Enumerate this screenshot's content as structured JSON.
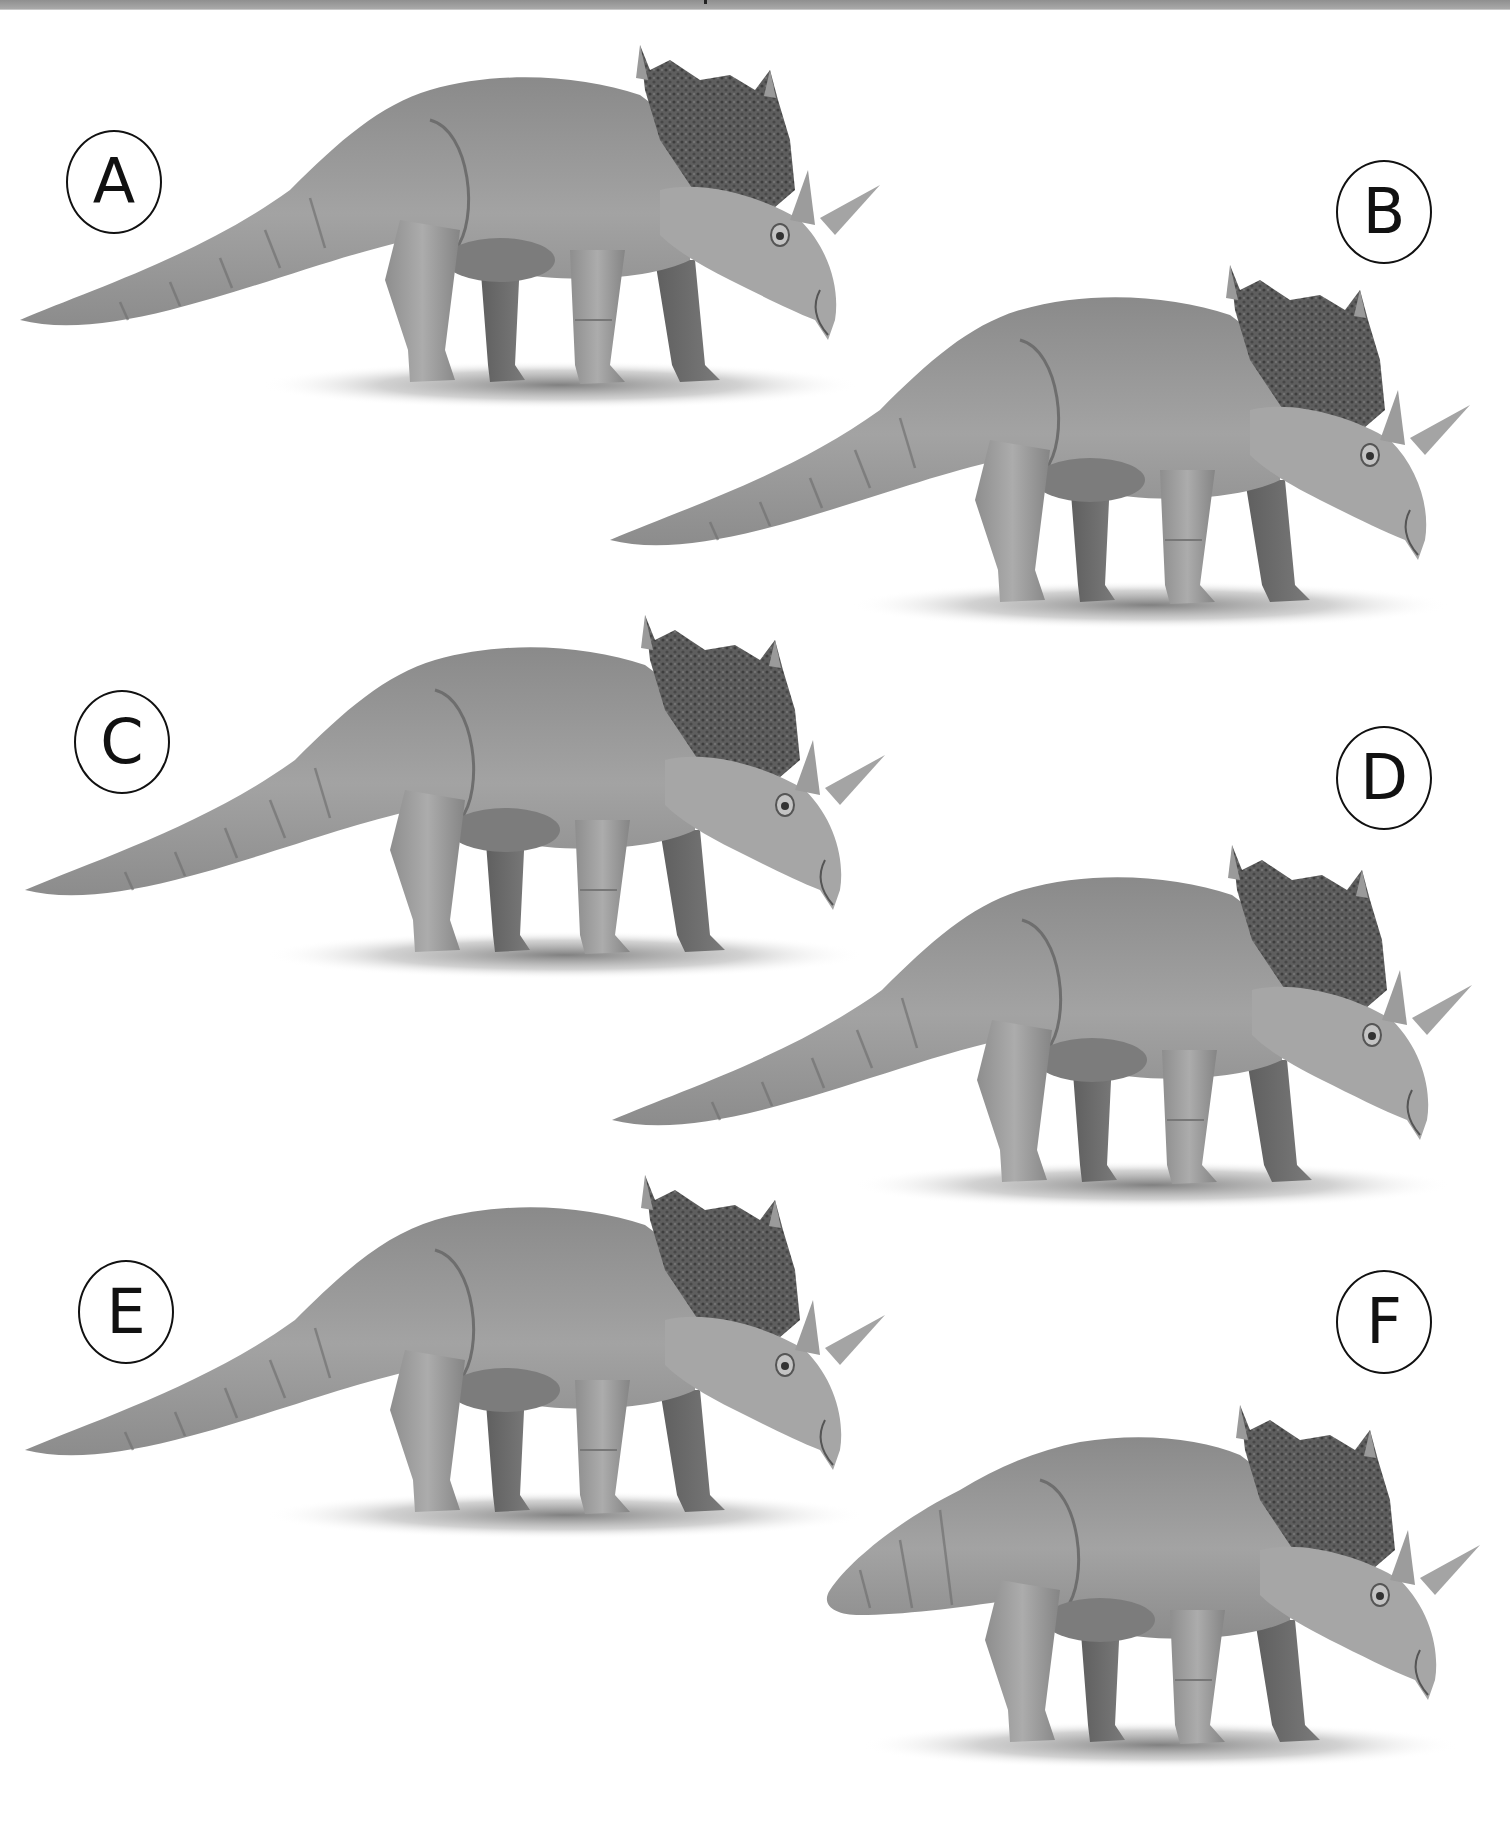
{
  "figure": {
    "color_scheme": "grayscale",
    "background": "#ffffff",
    "top_band_color": "#9a9a9a",
    "panels": [
      {
        "label": "A",
        "tail": "long",
        "side": "left"
      },
      {
        "label": "B",
        "tail": "long",
        "side": "right"
      },
      {
        "label": "C",
        "tail": "long",
        "side": "left"
      },
      {
        "label": "D",
        "tail": "long",
        "side": "right"
      },
      {
        "label": "E",
        "tail": "long",
        "side": "left"
      },
      {
        "label": "F",
        "tail": "short",
        "side": "right"
      }
    ]
  }
}
